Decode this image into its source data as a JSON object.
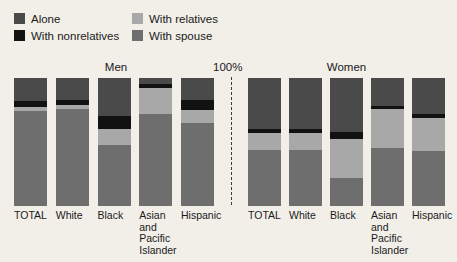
{
  "legend": {
    "items": [
      {
        "label": "Alone",
        "color": "#4a4a4a",
        "key": "alone"
      },
      {
        "label": "With relatives",
        "color": "#a8a8a8",
        "key": "relatives"
      },
      {
        "label": "With nonrelatives",
        "color": "#121212",
        "key": "nonrelatives"
      },
      {
        "label": "With spouse",
        "color": "#6e6e6e",
        "key": "spouse"
      }
    ]
  },
  "axis_max_label": "100%",
  "colors": {
    "alone": "#4a4a4a",
    "nonrelatives": "#121212",
    "relatives": "#a8a8a8",
    "spouse": "#6e6e6e",
    "background": "#f2efe9",
    "divider": "#3a3a3a"
  },
  "chart_data": {
    "type": "bar",
    "title": "",
    "xlabel": "",
    "ylabel": "",
    "ylim": [
      0,
      100
    ],
    "grid": false,
    "stacked": true,
    "orientation": "vertical",
    "legend_position": "top-left",
    "annotations": [
      "100%"
    ],
    "panels": [
      {
        "name": "Men",
        "categories": [
          "TOTAL",
          "White",
          "Black",
          "Asian\nand\nPacific\nIslander",
          "Hispanic"
        ],
        "series": [
          {
            "name": "Alone",
            "key": "alone",
            "values": [
              18,
              17,
              30,
              5,
              17
            ]
          },
          {
            "name": "With nonrelatives",
            "key": "nonrelatives",
            "values": [
              5,
              4,
              10,
              3,
              8
            ]
          },
          {
            "name": "With relatives",
            "key": "relatives",
            "values": [
              3,
              3,
              12,
              20,
              10
            ]
          },
          {
            "name": "With spouse",
            "key": "spouse",
            "values": [
              74,
              76,
              48,
              72,
              65
            ]
          }
        ]
      },
      {
        "name": "Women",
        "categories": [
          "TOTAL",
          "White",
          "Black",
          "Asian\nand\nPacific\nIslander",
          "Hispanic"
        ],
        "series": [
          {
            "name": "Alone",
            "key": "alone",
            "values": [
              40,
              40,
              42,
              22,
              28
            ]
          },
          {
            "name": "With nonrelatives",
            "key": "nonrelatives",
            "values": [
              3,
              3,
              6,
              2,
              3
            ]
          },
          {
            "name": "With relatives",
            "key": "relatives",
            "values": [
              13,
              13,
              30,
              31,
              26
            ]
          },
          {
            "name": "With spouse",
            "key": "spouse",
            "values": [
              44,
              44,
              22,
              45,
              43
            ]
          }
        ]
      }
    ]
  }
}
